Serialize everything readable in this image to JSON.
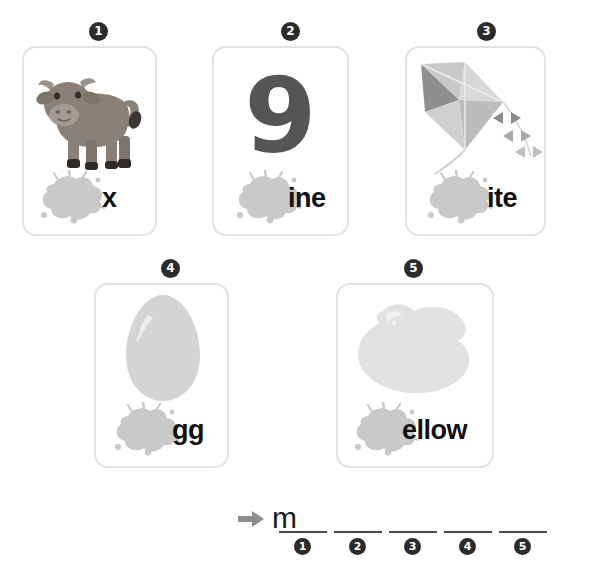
{
  "worksheet": {
    "type": "phonics-word-building-worksheet",
    "cards": [
      {
        "number": "1",
        "badge_glyph": "1",
        "picture": "ox-illustration",
        "picture_label": "ox",
        "word_ending": "x",
        "full_word": "ox",
        "missing_letter": "o"
      },
      {
        "number": "2",
        "badge_glyph": "2",
        "picture": "numeral-nine",
        "picture_label": "9",
        "numeral": "9",
        "word_ending": "ine",
        "full_word": "nine",
        "missing_letter": "n"
      },
      {
        "number": "3",
        "badge_glyph": "3",
        "picture": "kite-illustration",
        "picture_label": "kite",
        "word_ending": "ite",
        "full_word": "kite",
        "missing_letter": "k"
      },
      {
        "number": "4",
        "badge_glyph": "4",
        "picture": "egg-illustration",
        "picture_label": "egg",
        "word_ending": "gg",
        "full_word": "egg",
        "missing_letter": "e"
      },
      {
        "number": "5",
        "badge_glyph": "5",
        "picture": "yellow-paint-blob-illustration",
        "picture_label": "yellow",
        "word_ending": "ellow",
        "full_word": "yellow",
        "missing_letter": "y"
      }
    ],
    "answer": {
      "arrow_icon": "arrow-right-icon",
      "given_letter": "m",
      "blanks": [
        {
          "number": "1",
          "badge_glyph": "1",
          "value": ""
        },
        {
          "number": "2",
          "badge_glyph": "2",
          "value": ""
        },
        {
          "number": "3",
          "badge_glyph": "3",
          "value": ""
        },
        {
          "number": "4",
          "badge_glyph": "4",
          "value": ""
        },
        {
          "number": "5",
          "badge_glyph": "5",
          "value": ""
        }
      ]
    },
    "colors": {
      "card_border": "#e2e2e2",
      "badge_fill": "#2b2b2b",
      "badge_text": "#ffffff",
      "word_text": "#111111",
      "splat_gray": "#c9c9c9",
      "numeral_gray": "#555555",
      "arrow_gray": "#8c8c8c",
      "rule_gray": "#4a4a4a",
      "page_background": "#ffffff"
    }
  }
}
